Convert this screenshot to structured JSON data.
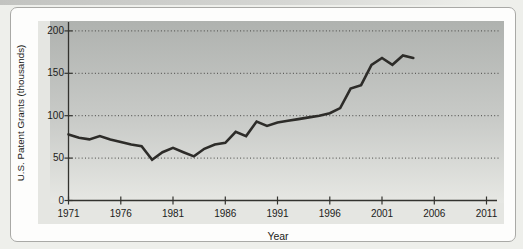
{
  "chart_data": {
    "type": "line",
    "title": "",
    "xlabel": "Year",
    "ylabel": "U.S. Patent Grants (thousands)",
    "x_ticks": [
      1971,
      1976,
      1981,
      1986,
      1991,
      1996,
      2001,
      2006,
      2011
    ],
    "y_ticks": [
      0,
      50,
      100,
      150,
      200
    ],
    "xlim": [
      1971,
      2013
    ],
    "ylim": [
      0,
      212
    ],
    "grid": "horizontal dotted gridlines at 50, 100, 150, 200",
    "legend": "none",
    "plot_bg_gradient": [
      "#afb2af",
      "#e7e8e4"
    ],
    "chart_bg": "#e5e6e2",
    "colors": {
      "axis": "#33332f",
      "grid": "#454543",
      "text": "#1c1c1a"
    },
    "series": [
      {
        "name": "U.S. patent grants per year",
        "color": "#2d2c29",
        "x": [
          1971,
          1972,
          1973,
          1974,
          1975,
          1976,
          1977,
          1978,
          1979,
          1980,
          1981,
          1982,
          1983,
          1984,
          1985,
          1986,
          1987,
          1988,
          1989,
          1990,
          1991,
          1992,
          1993,
          1994,
          1995,
          1996,
          1997,
          1998,
          1999,
          2000,
          2001,
          2002,
          2003,
          2004
        ],
        "y": [
          78,
          74,
          72,
          76,
          72,
          69,
          66,
          64,
          48,
          57,
          62,
          57,
          52,
          61,
          66,
          68,
          81,
          76,
          93,
          88,
          92,
          94,
          96,
          98,
          100,
          103,
          109,
          132,
          136,
          160,
          168,
          160,
          171,
          168
        ]
      }
    ]
  }
}
